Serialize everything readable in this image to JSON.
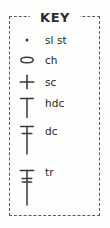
{
  "title": "KEY",
  "legend": {
    "heading": "KEY",
    "entries": [
      {
        "symbol": "dot",
        "symbol_name": "slip-stitch-dot-symbol",
        "label": "sl st"
      },
      {
        "symbol": "oval",
        "symbol_name": "chain-oval-symbol",
        "label": "ch"
      },
      {
        "symbol": "cross",
        "symbol_name": "single-crochet-cross-symbol",
        "label": "sc"
      },
      {
        "symbol": "tee",
        "symbol_name": "half-double-crochet-tee-symbol",
        "label": "hdc"
      },
      {
        "symbol": "tee-one-bar",
        "symbol_name": "double-crochet-symbol",
        "label": "dc"
      },
      {
        "symbol": "tee-two-bars",
        "symbol_name": "treble-crochet-symbol",
        "label": "tr"
      }
    ]
  },
  "colors": {
    "ink": "#3a3a3a",
    "border": "#5a5a5a",
    "text": "#262626",
    "background": "#fdfdfc"
  }
}
